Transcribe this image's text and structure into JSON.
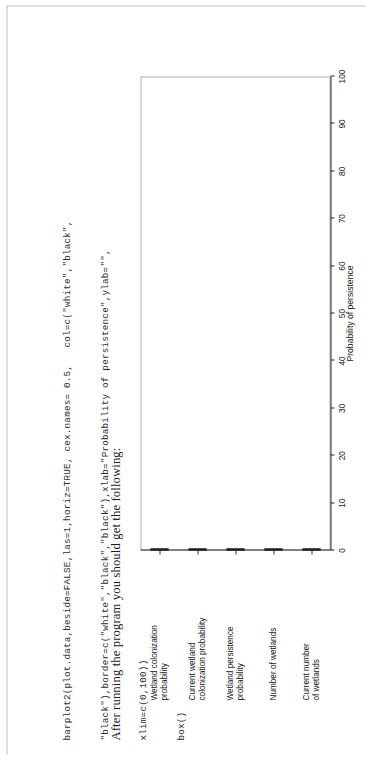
{
  "document": {
    "code_lines": [
      "barplot2(plot.data,beside=FALSE,las=1,horiz=TRUE, cex.names= 0.5,   col=c(\"white\",\"black\",",
      "\"black\"),border=c(\"white\",\"black\",\"black\"),xlab=\"Probability of persistence\",ylab=\"\",",
      "xlim=c(0,100))",
      "box()"
    ],
    "prose": "After running the program you should get the following:"
  },
  "chart_data": {
    "type": "bar",
    "orientation": "horizontal",
    "title": "",
    "xlabel": "Probability of persistence",
    "ylabel": "",
    "xlim": [
      0,
      100
    ],
    "grid": false,
    "legend": false,
    "categories": [
      "Wetland colonization probability",
      "Current wetland colonization probability",
      "Wetland persistence probability",
      "Number of wetlands",
      "Current number of wetlands"
    ],
    "category_lines": [
      [
        "Wetland colonization",
        "probability"
      ],
      [
        "Current wetland",
        "colonization probability"
      ],
      [
        "Wetland persistence",
        "probability"
      ],
      [
        "Number of wetlands",
        ""
      ],
      [
        "Current number",
        "of wetlands"
      ]
    ],
    "values": [
      92,
      90,
      85,
      32,
      34
    ],
    "xticks": [
      0,
      10,
      20,
      30,
      40,
      50,
      60,
      70,
      80,
      90,
      100
    ],
    "xtick_labels": [
      "0",
      "10",
      "20",
      "30",
      "40",
      "50",
      "60",
      "70",
      "80",
      "90",
      "100"
    ],
    "bar_color": "#1b1b1b",
    "bar_border_color": "#151515",
    "axis_color": "#2a2a2a"
  }
}
